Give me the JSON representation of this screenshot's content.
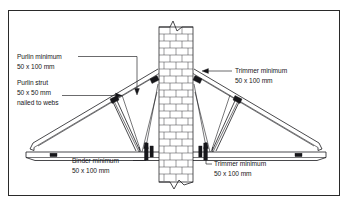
{
  "figure": {
    "type": "construction-detail-drawing",
    "title_visible": false,
    "border_color": "#2a2a2a",
    "background_color": "#ffffff",
    "line_color": "#1b1b1e"
  },
  "labels": {
    "purlin": {
      "line1": "Purlin minimum",
      "line2": "50 x 100 mm",
      "position": "top-left"
    },
    "purlin_strut": {
      "line1": "Purlin strut",
      "line2": "50 x 50 mm",
      "line3": "nailed to webs",
      "position": "mid-left"
    },
    "trimmer_top": {
      "line1": "Trimmer minimum",
      "line2": "50 x 100 mm",
      "position": "top-right"
    },
    "binder": {
      "line1": "Binder minimum",
      "line2": "50 x 100 mm",
      "position": "bottom-left"
    },
    "trimmer_bottom": {
      "line1": "Trimmer minimum",
      "line2": "50 x 100 mm",
      "position": "bottom-right"
    }
  },
  "components": {
    "wall": "brick-chimney-stack",
    "left_truss": "timber-roof-truss",
    "right_truss": "timber-roof-truss",
    "ceiling_tie": "bottom-chord-binder",
    "rafters": "sloping-top-chords",
    "webs": "internal-web-members"
  }
}
